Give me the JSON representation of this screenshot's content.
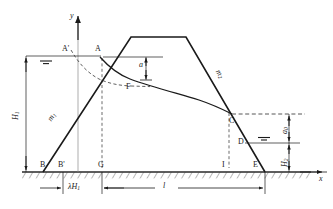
{
  "figure": {
    "caption": "",
    "colors": {
      "line": "#1a1a1a",
      "dashed": "#2b2b2b",
      "hatch": "#2b2b2b",
      "background": "#ffffff",
      "dimension": "#1a1a1a"
    }
  },
  "axes": {
    "x_label": "x",
    "y_label": "y"
  },
  "points": [
    {
      "id": "A-prime",
      "label": "A'",
      "x": 66,
      "y": 52
    },
    {
      "id": "A",
      "label": "A",
      "x": 97,
      "y": 52
    },
    {
      "id": "F",
      "label": "F",
      "x": 128,
      "y": 85
    },
    {
      "id": "C",
      "label": "C",
      "x": 233,
      "y": 115
    },
    {
      "id": "D",
      "label": "D",
      "x": 240,
      "y": 140
    },
    {
      "id": "B",
      "label": "B",
      "x": 43,
      "y": 163
    },
    {
      "id": "B-prime",
      "label": "B'",
      "x": 63,
      "y": 163
    },
    {
      "id": "G",
      "label": "G",
      "x": 102,
      "y": 163
    },
    {
      "id": "I",
      "label": "I",
      "x": 224,
      "y": 163
    },
    {
      "id": "E",
      "label": "E",
      "x": 265,
      "y": 163
    }
  ],
  "slopes": [
    {
      "id": "upstream-slope",
      "label": "m",
      "subscript": "1"
    },
    {
      "id": "downstream-slope",
      "label": "m",
      "subscript": "2"
    }
  ],
  "dimensions": [
    {
      "id": "upstream-head",
      "label": "H",
      "subscript": "1",
      "orientation": "vertical",
      "side": "left"
    },
    {
      "id": "entry-drop",
      "label": "a",
      "subscript": "",
      "orientation": "vertical",
      "side": "interior"
    },
    {
      "id": "seepage-exit-height",
      "label": "a",
      "subscript": "0",
      "orientation": "vertical",
      "side": "right"
    },
    {
      "id": "tailwater-depth",
      "label": "H",
      "subscript": "2",
      "orientation": "vertical",
      "side": "right"
    },
    {
      "id": "upstream-offset",
      "label": "λH",
      "subscript": "1",
      "orientation": "horizontal",
      "side": "bottom"
    },
    {
      "id": "seepage-length",
      "label": "l",
      "subscript": "",
      "orientation": "horizontal",
      "side": "bottom"
    }
  ],
  "water_levels": [
    {
      "id": "upstream-water-surface",
      "name": "upstream-water-table-symbol"
    },
    {
      "id": "tailwater-surface",
      "name": "tailwater-table-symbol"
    }
  ],
  "curves": [
    {
      "id": "seepage-line",
      "name": "phreatic-line-A-F-C",
      "style": "solid"
    },
    {
      "id": "basic-parabola",
      "name": "kozeny-parabola-dashed",
      "style": "dashed"
    },
    {
      "id": "dam-outline",
      "name": "dam-body-outline",
      "style": "solid"
    }
  ]
}
